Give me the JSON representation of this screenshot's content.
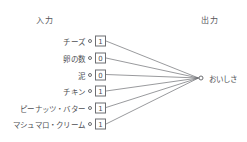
{
  "diagram": {
    "type": "neural-network-perceptron",
    "headers": {
      "input": "入力",
      "output": "出力"
    },
    "inputs": [
      {
        "label": "チーズ",
        "value": "1"
      },
      {
        "label": "卵の数",
        "value": "0"
      },
      {
        "label": "泥",
        "value": "0"
      },
      {
        "label": "チキン",
        "value": "1"
      },
      {
        "label": "ピーナッツ・バター",
        "value": "1"
      },
      {
        "label": "マシュマロ・クリーム",
        "value": "1"
      }
    ],
    "output": {
      "label": "おいしさ"
    },
    "colors": {
      "background": "#ffffff",
      "stroke": "#6d6e72",
      "text": "#4e4f53",
      "header_text": "#55565a"
    }
  }
}
